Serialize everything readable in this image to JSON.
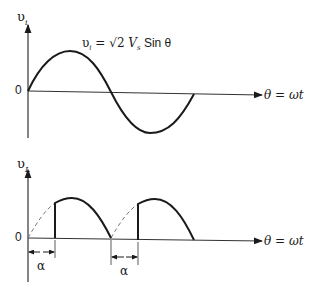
{
  "top_plot": {
    "y_axis_label": "υ",
    "y_axis_subscript": "i",
    "origin_label": "0",
    "x_axis_label": "θ = ωt",
    "equation": {
      "lhs": "υ",
      "lhs_sub": "i",
      "eq": " = √2 ",
      "v": "V",
      "v_sub": "s",
      "rest": " Sin θ"
    }
  },
  "bottom_plot": {
    "y_axis_label": "υ",
    "y_axis_subscript": "L",
    "origin_label": "0",
    "x_axis_label": "θ = ωt",
    "alpha_label_1": "α",
    "alpha_label_2": "α"
  },
  "colors": {
    "stroke": "#1a1a1a",
    "axis": "#333333",
    "dashed": "#777777"
  }
}
